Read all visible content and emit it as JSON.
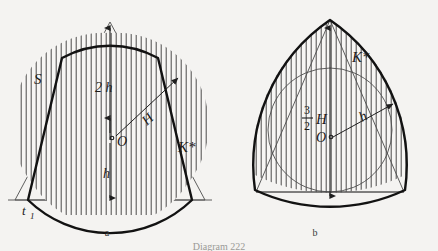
{
  "figure": {
    "caption": "Diagram 222",
    "background_color": "#f4f3f1",
    "ink_color": "#121212"
  },
  "panels": [
    {
      "id": "a",
      "sub_caption": "a",
      "description": "Equilateral triangle with circumscribed circle S and bold convex region K* of constant width formed by circular caps, vertical hatching fill",
      "labels": {
        "region": "K*",
        "circle": "S",
        "tangent_line": "t",
        "tangent_line_subscript": "1",
        "center": "O",
        "radius": "H",
        "upper_dimension": "2 h",
        "lower_dimension": "h"
      }
    },
    {
      "id": "b",
      "sub_caption": "b",
      "description": "Reuleaux-style bulged triangle K* with inscribed circle, vertical hatching fill",
      "labels": {
        "region": "K*",
        "center": "O",
        "radius": "h",
        "dimension_numerator": "3",
        "dimension_denominator": "2",
        "dimension_symbol": "H"
      }
    }
  ]
}
